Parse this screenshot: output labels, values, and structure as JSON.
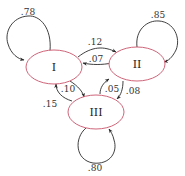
{
  "diagram": {
    "type": "markov-chain-state-transition",
    "nodes": [
      {
        "id": "I",
        "label": "I"
      },
      {
        "id": "II",
        "label": "II"
      },
      {
        "id": "III",
        "label": "III"
      }
    ],
    "edges": [
      {
        "from": "I",
        "to": "I",
        "label": ".78"
      },
      {
        "from": "II",
        "to": "II",
        "label": ".85"
      },
      {
        "from": "III",
        "to": "III",
        "label": ".80"
      },
      {
        "from": "I",
        "to": "II",
        "label": ".12"
      },
      {
        "from": "II",
        "to": "I",
        "label": ".07"
      },
      {
        "from": "I",
        "to": "III",
        "label": ".10"
      },
      {
        "from": "III",
        "to": "I",
        "label": ".15"
      },
      {
        "from": "III",
        "to": "II",
        "label": ".05"
      },
      {
        "from": "II",
        "to": "III",
        "label": ".08"
      }
    ],
    "colors": {
      "node_stroke": "#c8546a",
      "edge_stroke": "#2a2a2a"
    }
  }
}
